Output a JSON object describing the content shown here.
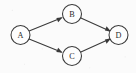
{
  "diagram": {
    "type": "directed-graph",
    "background_color": "#fbfbfb",
    "stroke_color": "#3a3a3a",
    "node_fill_color": "#fdfdfd",
    "node_radius": 9.5,
    "nodes": [
      {
        "id": "A",
        "label": "A",
        "cx": 20.5,
        "cy": 35.0
      },
      {
        "id": "B",
        "label": "B",
        "cx": 72.0,
        "cy": 14.0
      },
      {
        "id": "C",
        "label": "C",
        "cx": 72.0,
        "cy": 56.0
      },
      {
        "id": "D",
        "label": "D",
        "cx": 118.5,
        "cy": 35.0
      }
    ],
    "edges": [
      {
        "id": "A-B",
        "from": "A",
        "to": "B",
        "directed": true,
        "arrow_at": "B"
      },
      {
        "id": "A-C",
        "from": "A",
        "to": "C",
        "directed": true,
        "arrow_at": "C"
      },
      {
        "id": "B-D",
        "from": "B",
        "to": "D",
        "directed": true,
        "arrow_at": "D"
      },
      {
        "id": "C-D",
        "from": "C",
        "to": "D",
        "directed": true,
        "arrow_at": "D"
      }
    ]
  }
}
